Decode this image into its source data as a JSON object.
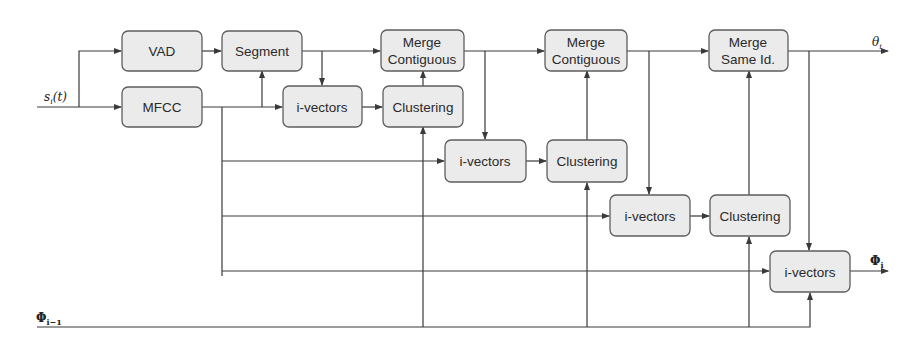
{
  "diagram": {
    "input_label": "s",
    "input_sub": "i",
    "input_arg": "(t)",
    "prev_label": "Φ",
    "prev_sub": "i−1",
    "out_theta": "θ",
    "out_theta_sub": "i",
    "out_phi": "Φ",
    "out_phi_sub": "i",
    "nodes": {
      "vad": "VAD",
      "mfcc": "MFCC",
      "segment": "Segment",
      "ivectors1": "i-vectors",
      "clustering1": "Clustering",
      "merge1_l1": "Merge",
      "merge1_l2": "Contiguous",
      "ivectors2": "i-vectors",
      "clustering2": "Clustering",
      "merge2_l1": "Merge",
      "merge2_l2": "Contiguous",
      "ivectors3": "i-vectors",
      "clustering3": "Clustering",
      "mergesame_l1": "Merge",
      "mergesame_l2": "Same Id.",
      "ivectors4": "i-vectors"
    }
  }
}
